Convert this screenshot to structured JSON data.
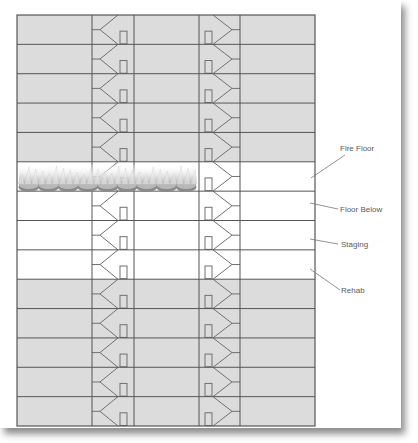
{
  "diagram": {
    "building": {
      "x": 17,
      "y": 15,
      "width": 298,
      "height": 411,
      "floor_count": 14,
      "columns_x": [
        92,
        134,
        199,
        240
      ],
      "stairwells": [
        {
          "name": "stairwell-a",
          "left": 92,
          "right": 134,
          "orientation": "left"
        },
        {
          "name": "stairwell-b",
          "left": 199,
          "right": 240,
          "orientation": "right"
        }
      ],
      "floors": [
        {
          "index": 1,
          "role": "upper",
          "shaded": true
        },
        {
          "index": 2,
          "role": "upper",
          "shaded": true
        },
        {
          "index": 3,
          "role": "upper",
          "shaded": true
        },
        {
          "index": 4,
          "role": "upper",
          "shaded": true
        },
        {
          "index": 5,
          "role": "upper",
          "shaded": true
        },
        {
          "index": 6,
          "role": "fire-floor",
          "shaded": false,
          "fire": true
        },
        {
          "index": 7,
          "role": "floor-below",
          "shaded": false
        },
        {
          "index": 8,
          "role": "staging",
          "shaded": false
        },
        {
          "index": 9,
          "role": "rehab",
          "shaded": false
        },
        {
          "index": 10,
          "role": "lower",
          "shaded": true
        },
        {
          "index": 11,
          "role": "lower",
          "shaded": true
        },
        {
          "index": 12,
          "role": "lower",
          "shaded": true
        },
        {
          "index": 13,
          "role": "lower",
          "shaded": true
        },
        {
          "index": 14,
          "role": "lower",
          "shaded": true
        }
      ]
    },
    "labels": [
      {
        "text": "Fire Floor",
        "x": 340,
        "y": 151,
        "line": [
          311,
          178,
          345,
          155
        ]
      },
      {
        "text": "Floor Below",
        "x": 340,
        "y": 212,
        "line": [
          310,
          203,
          338,
          209
        ]
      },
      {
        "text": "Staging",
        "x": 341,
        "y": 247,
        "line": [
          310,
          239,
          338,
          244
        ]
      },
      {
        "text": "Rehab",
        "x": 341,
        "y": 293,
        "line": [
          310,
          269,
          340,
          290
        ]
      }
    ],
    "fire": {
      "x": 19,
      "y": 165,
      "width": 177,
      "height": 27,
      "icon": "flames-icon"
    },
    "colors": {
      "shaded_floor": "#dcdcdc",
      "unshaded_floor": "#ffffff",
      "lines": "#555555",
      "stair_lines": "#707070",
      "label_text": "#5a5a5a",
      "leader_line": "#777777"
    }
  }
}
